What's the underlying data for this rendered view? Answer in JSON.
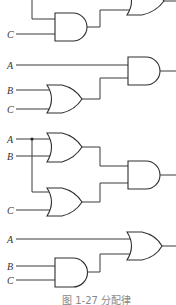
{
  "diagram": {
    "type": "logic-circuit",
    "caption": "图 1-27  分配律",
    "colors": {
      "wire": "#3a3a3a",
      "gate_stroke": "#2e2e2e",
      "background": "#ffffff"
    },
    "circuits": [
      {
        "id": "circuit-1-partial",
        "inputs": [
          {
            "label": "C"
          }
        ],
        "gates": [
          {
            "type": "AND"
          },
          {
            "type": "OR"
          }
        ]
      },
      {
        "id": "circuit-2",
        "expression": "A·(B+C)",
        "inputs": [
          {
            "label": "A"
          },
          {
            "label": "B"
          },
          {
            "label": "C"
          }
        ],
        "gates": [
          {
            "type": "OR",
            "inputs": [
              "B",
              "C"
            ]
          },
          {
            "type": "AND",
            "inputs": [
              "A",
              "OR"
            ]
          }
        ]
      },
      {
        "id": "circuit-3",
        "expression": "(A+B)·(A+C)",
        "inputs": [
          {
            "label": "A"
          },
          {
            "label": "B"
          },
          {
            "label": "C"
          }
        ],
        "gates": [
          {
            "type": "OR",
            "inputs": [
              "A",
              "B"
            ]
          },
          {
            "type": "OR",
            "inputs": [
              "A",
              "C"
            ]
          },
          {
            "type": "AND",
            "inputs": [
              "OR1",
              "OR2"
            ]
          }
        ]
      },
      {
        "id": "circuit-4",
        "expression": "A+B·C",
        "inputs": [
          {
            "label": "A"
          },
          {
            "label": "B"
          },
          {
            "label": "C"
          }
        ],
        "gates": [
          {
            "type": "AND",
            "inputs": [
              "B",
              "C"
            ]
          },
          {
            "type": "OR",
            "inputs": [
              "A",
              "AND"
            ]
          }
        ]
      }
    ]
  }
}
